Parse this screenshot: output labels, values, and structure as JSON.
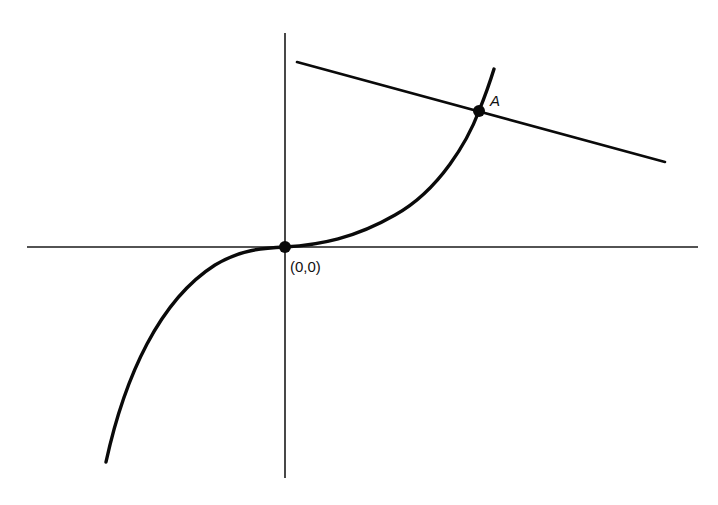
{
  "diagram": {
    "type": "graph-sketch",
    "axes": {
      "x_axis": {
        "from": [
          27,
          247
        ],
        "to": [
          698,
          247
        ]
      },
      "y_axis": {
        "from": [
          285,
          33
        ],
        "to": [
          285,
          478
        ]
      }
    },
    "curve": {
      "shape": "cubic (inflection at origin)",
      "start": [
        106,
        462
      ],
      "passes_through": [
        [
          285,
          247
        ],
        [
          479,
          111
        ]
      ],
      "end": [
        494,
        69
      ]
    },
    "line": {
      "start": [
        297,
        62
      ],
      "end": [
        665,
        162
      ],
      "slope_sign": "negative"
    },
    "points": [
      {
        "id": "origin",
        "label": "(0,0)",
        "position": [
          285,
          247
        ]
      },
      {
        "id": "A",
        "label": "A",
        "position": [
          479,
          111
        ]
      }
    ],
    "colors": {
      "ink": "#0a0a0a",
      "background": "#ffffff"
    }
  }
}
